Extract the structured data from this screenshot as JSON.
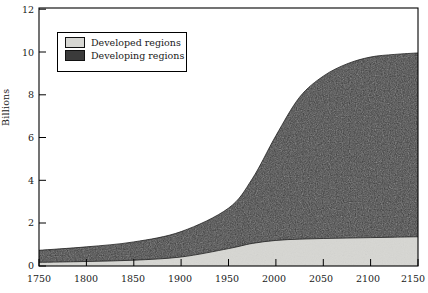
{
  "figure": {
    "background_color": "#ffffff",
    "frame_color": "#000000"
  },
  "axes": {
    "ylabel": "Billions",
    "ytick_labels": [
      "0",
      "2",
      "4",
      "6",
      "8",
      "10",
      "12"
    ],
    "xtick_labels": [
      "1750",
      "1800",
      "1850",
      "1900",
      "1950",
      "2000",
      "2050",
      "2100",
      "2150"
    ]
  },
  "legend": {
    "items": [
      {
        "label": "Developed regions",
        "color": "#d7d7d3",
        "swatch_name": "legend-swatch-developed"
      },
      {
        "label": "Developing regions",
        "color": "#3b3b3b",
        "swatch_name": "legend-swatch-developing"
      }
    ]
  },
  "chart_data": {
    "type": "area",
    "stacked": true,
    "title": "",
    "subtitle": "",
    "xlabel": "",
    "ylabel": "Billions",
    "xlim": [
      1750,
      2150
    ],
    "ylim": [
      0,
      12
    ],
    "xticks": [
      1750,
      1800,
      1850,
      1900,
      1950,
      2000,
      2050,
      2100,
      2150
    ],
    "yticks": [
      0,
      2,
      4,
      6,
      8,
      10,
      12
    ],
    "grid": false,
    "legend_position": "upper-left-inside",
    "x": [
      1750,
      1800,
      1850,
      1900,
      1950,
      1975,
      2000,
      2025,
      2050,
      2075,
      2100,
      2125,
      2150
    ],
    "series": [
      {
        "name": "Developed regions",
        "color": "#d7d7d3",
        "values": [
          0.17,
          0.21,
          0.27,
          0.42,
          0.81,
          1.05,
          1.19,
          1.25,
          1.28,
          1.3,
          1.32,
          1.34,
          1.36
        ]
      },
      {
        "name": "Developing regions",
        "color": "#3b3b3b",
        "values": [
          0.56,
          0.68,
          0.85,
          1.18,
          1.88,
          3.0,
          4.87,
          6.6,
          7.55,
          8.1,
          8.4,
          8.5,
          8.55
        ]
      }
    ],
    "totals": [
      0.73,
      0.89,
      1.12,
      1.6,
      2.69,
      4.05,
      6.06,
      7.85,
      8.83,
      9.4,
      9.72,
      9.84,
      9.91
    ],
    "annotations": []
  }
}
